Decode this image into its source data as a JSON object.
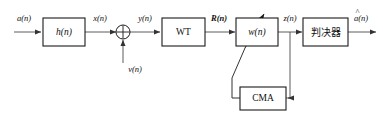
{
  "diagram": {
    "colors": {
      "background": "#ffffff",
      "block_stroke": "#1a1a1a",
      "wire": "#4a4a4a",
      "text": "#111111"
    },
    "blocks": [
      {
        "id": "channel",
        "label": "h(n)",
        "style": "math"
      },
      {
        "id": "wt",
        "label": "WT",
        "style": "plain"
      },
      {
        "id": "equalizer",
        "label": "w(n)",
        "style": "math"
      },
      {
        "id": "decision",
        "label": "判决器",
        "style": "cjk"
      },
      {
        "id": "cma",
        "label": "CMA",
        "style": "plain"
      }
    ],
    "signals": [
      {
        "id": "input",
        "label": "a(n)",
        "bold": false
      },
      {
        "id": "channel-out",
        "label": "x(n)",
        "bold": false
      },
      {
        "id": "noise",
        "label": "v(n)",
        "bold": false
      },
      {
        "id": "sum-out",
        "label": "y(n)",
        "bold": false
      },
      {
        "id": "wt-out",
        "label": "R(n)",
        "bold": true
      },
      {
        "id": "equalizer-out",
        "label": "z(n)",
        "bold": false
      },
      {
        "id": "output",
        "label": "a(n)",
        "bold": false,
        "hat": "^"
      }
    ],
    "summing_junction": {
      "id": "adder",
      "operator": "cross"
    },
    "icons": {
      "arrowhead": "arrowhead-icon",
      "adaptation": "adaptation-arrow-icon"
    }
  }
}
